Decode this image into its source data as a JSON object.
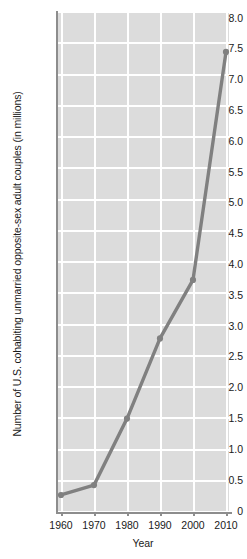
{
  "chart_data": {
    "type": "line",
    "title": "",
    "xlabel": "Year",
    "ylabel": "Number of U.S. cohabiting unmarried opposite-sex adult couples (in millions)",
    "x": [
      1960,
      1970,
      1980,
      1990,
      2000,
      2010
    ],
    "values": [
      0.26,
      0.42,
      1.5,
      2.8,
      3.75,
      7.45
    ],
    "series": [
      {
        "name": "Cohabiting unmarried opposite-sex adult couples",
        "values": [
          0.26,
          0.42,
          1.5,
          2.8,
          3.75,
          7.45
        ]
      }
    ],
    "xlim": [
      1955,
      2015
    ],
    "ylim": [
      0,
      8.0
    ],
    "xtick_labels": [
      "1960",
      "1970",
      "1980",
      "1990",
      "2000",
      "2010"
    ],
    "ytick_labels": [
      "0",
      "0.5",
      "1.0",
      "1.5",
      "2.0",
      "2.5",
      "3.0",
      "3.5",
      "4.0",
      "4.5",
      "5.0",
      "5.5",
      "6.0",
      "6.5",
      "7.0",
      "7.5",
      "8.0"
    ],
    "ytick_values": [
      0,
      0.5,
      1.0,
      1.5,
      2.0,
      2.5,
      3.0,
      3.5,
      4.0,
      4.5,
      5.0,
      5.5,
      6.0,
      6.5,
      7.0,
      7.5,
      8.0
    ],
    "grid": true,
    "legend": "none",
    "colors": {
      "line": "#808080",
      "marker": "#808080",
      "plot_background": "#dcdcdc",
      "gridline": "#ffffff",
      "axis": "#8d8d8d",
      "text": "#1a1a1a",
      "page_background": "#ffffff"
    }
  }
}
